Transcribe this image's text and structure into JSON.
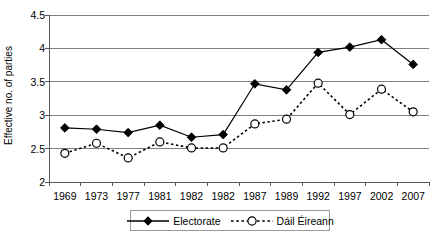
{
  "chart_data": {
    "type": "line",
    "title": "",
    "xlabel": "",
    "ylabel": "Effective no. of parties",
    "ylim": [
      2,
      4.5
    ],
    "yticks": [
      2,
      2.5,
      3,
      3.5,
      4,
      4.5
    ],
    "ytick_labels": [
      "2",
      "2.5",
      "3",
      "3.5",
      "4",
      "4.5"
    ],
    "grid": "horizontal",
    "legend_position": "bottom",
    "categories": [
      "1969",
      "1973",
      "1977",
      "1981",
      "1982",
      "1982",
      "1987",
      "1989",
      "1992",
      "1997",
      "2002",
      "2007"
    ],
    "series": [
      {
        "name": "Electorate",
        "marker": "filled-diamond",
        "line_style": "solid",
        "color": "#000000",
        "values": [
          2.81,
          2.79,
          2.74,
          2.85,
          2.67,
          2.71,
          3.47,
          3.38,
          3.94,
          4.02,
          4.13,
          3.76
        ]
      },
      {
        "name": "Dáil Éireann",
        "marker": "open-circle",
        "line_style": "dotted",
        "color": "#000000",
        "values": [
          2.43,
          2.58,
          2.36,
          2.6,
          2.51,
          2.51,
          2.87,
          2.94,
          3.48,
          3.01,
          3.39,
          3.05
        ]
      }
    ]
  },
  "legend": {
    "entries": [
      {
        "label": "Electorate"
      },
      {
        "label": "Dáil Éireann"
      }
    ]
  }
}
